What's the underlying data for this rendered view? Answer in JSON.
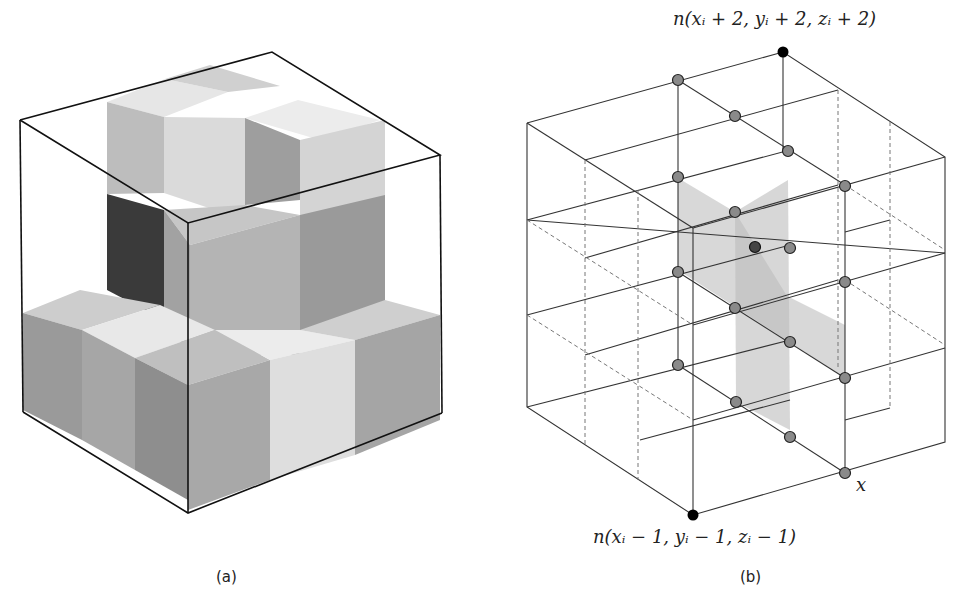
{
  "figure_a": {
    "caption": "(a)",
    "description": "3x3x3 voxel block with stacked gray cubes inside a wireframe cube"
  },
  "figure_b": {
    "caption": "(b)",
    "top_label": "n(xᵢ + 2, yᵢ + 2, zᵢ + 2)",
    "bottom_label": "n(xᵢ − 1, yᵢ − 1, zᵢ − 1)",
    "axis_label": "x",
    "colors": {
      "node_gray": "#8a8a8a",
      "node_black": "#000000",
      "plane": "#bdbdbd"
    }
  }
}
